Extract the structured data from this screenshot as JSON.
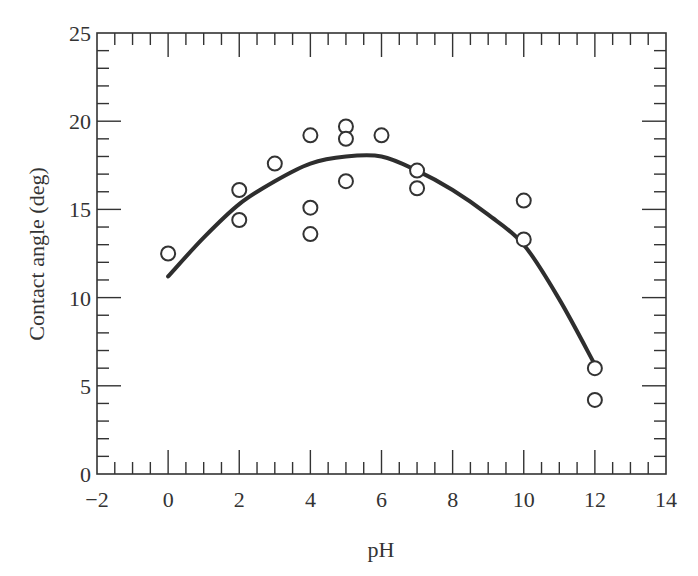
{
  "chart_data": {
    "type": "scatter",
    "title": "",
    "xlabel": "pH",
    "ylabel": "Contact angle (deg)",
    "xlim": [
      -2,
      14
    ],
    "ylim": [
      0,
      25
    ],
    "x_ticks": [
      -2,
      0,
      2,
      4,
      6,
      8,
      10,
      12,
      14
    ],
    "x_tick_labels": [
      "−2",
      "0",
      "2",
      "4",
      "6",
      "8",
      "10",
      "12",
      "14"
    ],
    "y_ticks": [
      0,
      5,
      10,
      15,
      20,
      25
    ],
    "y_tick_labels": [
      "0",
      "5",
      "10",
      "15",
      "20",
      "25"
    ],
    "grid": false,
    "legend": null,
    "series": [
      {
        "name": "measured",
        "marker": "open-circle",
        "points": [
          {
            "x": 0,
            "y": 12.5
          },
          {
            "x": 2,
            "y": 16.1
          },
          {
            "x": 2,
            "y": 14.4
          },
          {
            "x": 3,
            "y": 17.6
          },
          {
            "x": 4,
            "y": 19.2
          },
          {
            "x": 4,
            "y": 15.1
          },
          {
            "x": 4,
            "y": 13.6
          },
          {
            "x": 5,
            "y": 19.7
          },
          {
            "x": 5,
            "y": 19.0
          },
          {
            "x": 5,
            "y": 16.6
          },
          {
            "x": 6,
            "y": 19.2
          },
          {
            "x": 7,
            "y": 17.2
          },
          {
            "x": 7,
            "y": 16.2
          },
          {
            "x": 10,
            "y": 15.5
          },
          {
            "x": 10,
            "y": 13.3
          },
          {
            "x": 12,
            "y": 6.0
          },
          {
            "x": 12,
            "y": 4.2
          }
        ]
      },
      {
        "name": "fit",
        "type": "line",
        "points": [
          {
            "x": 0,
            "y": 11.2
          },
          {
            "x": 1,
            "y": 13.4
          },
          {
            "x": 2,
            "y": 15.3
          },
          {
            "x": 3,
            "y": 16.6
          },
          {
            "x": 4,
            "y": 17.6
          },
          {
            "x": 5,
            "y": 18.0
          },
          {
            "x": 6,
            "y": 18.0
          },
          {
            "x": 7,
            "y": 17.2
          },
          {
            "x": 8,
            "y": 16.1
          },
          {
            "x": 9,
            "y": 14.7
          },
          {
            "x": 10,
            "y": 13.0
          },
          {
            "x": 11,
            "y": 9.9
          },
          {
            "x": 12,
            "y": 6.2
          }
        ]
      }
    ]
  }
}
